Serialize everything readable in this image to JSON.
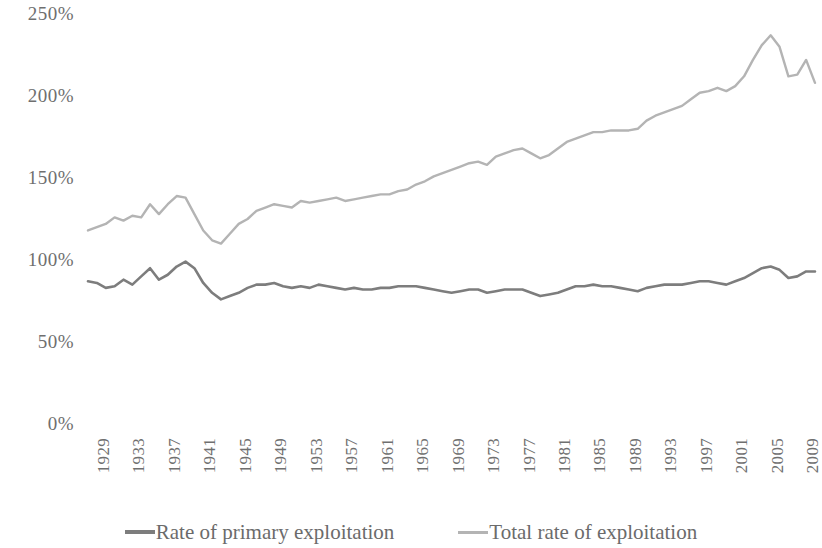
{
  "chart_data": {
    "type": "line",
    "title": "",
    "subtitle": "",
    "xlabel": "",
    "ylabel": "",
    "ylim": [
      0,
      250
    ],
    "xlim": [
      1929,
      2011
    ],
    "grid": false,
    "legend_position": "bottom",
    "y_ticks": [
      "0%",
      "50%",
      "100%",
      "150%",
      "200%",
      "250%"
    ],
    "y_tick_values": [
      0,
      50,
      100,
      150,
      200,
      250
    ],
    "x_ticks": [
      "1929",
      "1933",
      "1937",
      "1941",
      "1945",
      "1949",
      "1953",
      "1957",
      "1961",
      "1965",
      "1969",
      "1973",
      "1977",
      "1981",
      "1985",
      "1989",
      "1993",
      "1997",
      "2001",
      "2005",
      "2009"
    ],
    "x_tick_values": [
      1929,
      1933,
      1937,
      1941,
      1945,
      1949,
      1953,
      1957,
      1961,
      1965,
      1969,
      1973,
      1977,
      1981,
      1985,
      1989,
      1993,
      1997,
      2001,
      2005,
      2009
    ],
    "x": [
      1929,
      1930,
      1931,
      1932,
      1933,
      1934,
      1935,
      1936,
      1937,
      1938,
      1939,
      1940,
      1941,
      1942,
      1943,
      1944,
      1945,
      1946,
      1947,
      1948,
      1949,
      1950,
      1951,
      1952,
      1953,
      1954,
      1955,
      1956,
      1957,
      1958,
      1959,
      1960,
      1961,
      1962,
      1963,
      1964,
      1965,
      1966,
      1967,
      1968,
      1969,
      1970,
      1971,
      1972,
      1973,
      1974,
      1975,
      1976,
      1977,
      1978,
      1979,
      1980,
      1981,
      1982,
      1983,
      1984,
      1985,
      1986,
      1987,
      1988,
      1989,
      1990,
      1991,
      1992,
      1993,
      1994,
      1995,
      1996,
      1997,
      1998,
      1999,
      2000,
      2001,
      2002,
      2003,
      2004,
      2005,
      2006,
      2007,
      2008,
      2009,
      2010,
      2011
    ],
    "series": [
      {
        "name": "Rate of primary exploitation",
        "color": "#7d7d7d",
        "width": 2.6,
        "values": [
          87,
          86,
          83,
          84,
          88,
          85,
          90,
          95,
          88,
          91,
          96,
          99,
          95,
          86,
          80,
          76,
          78,
          80,
          83,
          85,
          85,
          86,
          84,
          83,
          84,
          83,
          85,
          84,
          83,
          82,
          83,
          82,
          82,
          83,
          83,
          84,
          84,
          84,
          83,
          82,
          81,
          80,
          81,
          82,
          82,
          80,
          81,
          82,
          82,
          82,
          80,
          78,
          79,
          80,
          82,
          84,
          84,
          85,
          84,
          84,
          83,
          82,
          81,
          83,
          84,
          85,
          85,
          85,
          86,
          87,
          87,
          86,
          85,
          87,
          89,
          92,
          95,
          96,
          94,
          89,
          90,
          93,
          93
        ]
      },
      {
        "name": "Total rate of exploitation",
        "color": "#b4b4b4",
        "width": 2.4,
        "values": [
          118,
          120,
          122,
          126,
          124,
          127,
          126,
          134,
          128,
          134,
          139,
          138,
          128,
          118,
          112,
          110,
          116,
          122,
          125,
          130,
          132,
          134,
          133,
          132,
          136,
          135,
          136,
          137,
          138,
          136,
          137,
          138,
          139,
          140,
          140,
          142,
          143,
          146,
          148,
          151,
          153,
          155,
          157,
          159,
          160,
          158,
          163,
          165,
          167,
          168,
          165,
          162,
          164,
          168,
          172,
          174,
          176,
          178,
          178,
          179,
          179,
          179,
          180,
          185,
          188,
          190,
          192,
          194,
          198,
          202,
          203,
          205,
          203,
          206,
          212,
          222,
          231,
          237,
          230,
          212,
          213,
          222,
          208
        ]
      }
    ]
  },
  "legend": {
    "entries": [
      {
        "label": "Rate of primary exploitation",
        "color": "#7d7d7d"
      },
      {
        "label": "Total rate of exploitation",
        "color": "#b4b4b4"
      }
    ]
  }
}
